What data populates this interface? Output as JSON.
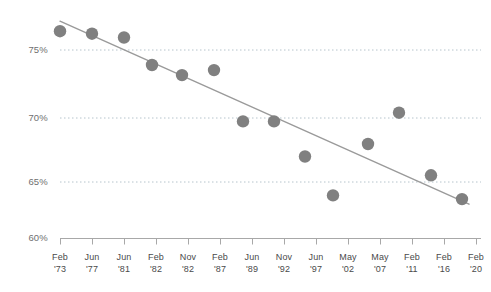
{
  "chart_data": {
    "type": "scatter",
    "title": "",
    "subtitle": "",
    "xlabel": "",
    "ylabel": "",
    "ylim": [
      60,
      77.5
    ],
    "yticks": [
      75,
      70,
      65,
      60
    ],
    "ytick_labels": [
      "75%",
      "70%",
      "65%",
      "60%"
    ],
    "grid": true,
    "gridlines_dotted": [
      75,
      70,
      65
    ],
    "legend": "none",
    "categories": [
      "Feb '73",
      "Jun '77",
      "Jun '81",
      "Feb '82",
      "Nov '82",
      "Feb '87",
      "Jun '89",
      "Nov '92",
      "Jun '97",
      "May '02",
      "May '07",
      "Feb '11",
      "Feb '16",
      "Feb '20"
    ],
    "xtick_months": [
      "Feb",
      "Jun",
      "Jun",
      "Feb",
      "Nov",
      "Feb",
      "Jun",
      "Nov",
      "Jun",
      "May",
      "May",
      "Feb",
      "Feb",
      "Feb"
    ],
    "xtick_years": [
      "'73",
      "'77",
      "'81",
      "'82",
      "'82",
      "'87",
      "'89",
      "'92",
      "'97",
      "'02",
      "'07",
      "'11",
      "'16",
      "'20"
    ],
    "values": [
      76.5,
      76.3,
      76.0,
      73.8,
      73.0,
      73.4,
      69.3,
      69.3,
      66.5,
      63.4,
      67.5,
      70.0,
      65.0,
      63.1
    ],
    "series": [
      {
        "name": "Observed",
        "values": [
          76.5,
          76.3,
          76.0,
          73.8,
          73.0,
          73.4,
          69.3,
          69.3,
          66.5,
          63.4,
          67.5,
          70.0,
          65.0,
          63.1
        ]
      }
    ],
    "trendline": {
      "type": "linear",
      "start": {
        "x": "Feb '73",
        "y": 77.3
      },
      "end": {
        "x": "Feb '20",
        "y": 62.7
      }
    },
    "colors": {
      "point": "#808080",
      "trendline": "#9a9a9a",
      "gridline": "#b9c7cf",
      "axis": "#9a9a9a",
      "text": "#4a4a4a",
      "ylabel_text": "#6f6f6f",
      "background": "#ffffff"
    }
  }
}
